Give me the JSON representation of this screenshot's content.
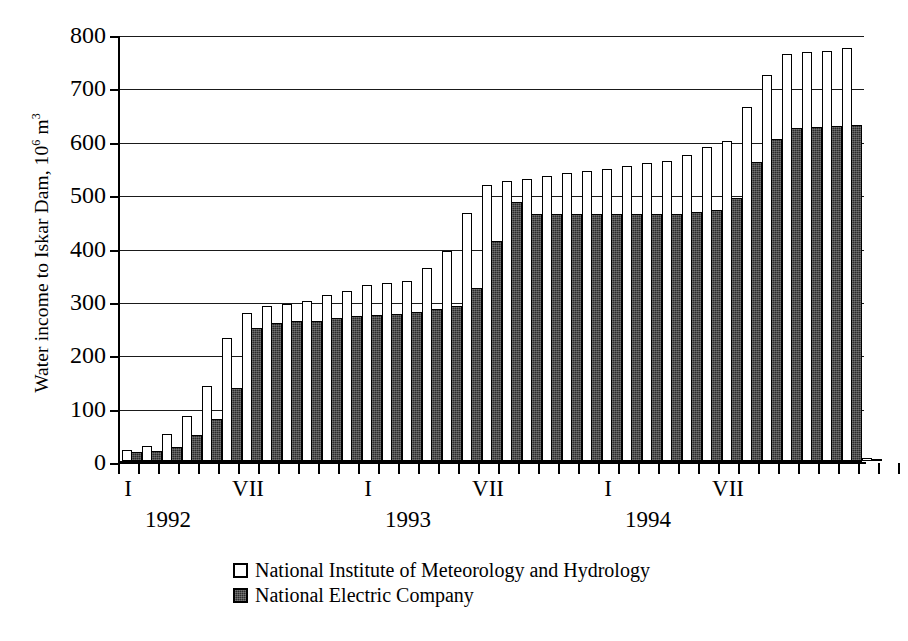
{
  "chart_data": {
    "type": "bar",
    "title": "",
    "xlabel": "",
    "ylabel": "Water income to Iskar Dam, 10^6 m^3",
    "ylabel_parts": {
      "prefix": "Water income to Iskar Dam, 10",
      "exponent": "6",
      "suffix": " m",
      "suffix_exponent": "3"
    },
    "ylim": [
      0,
      800
    ],
    "yticks": [
      0,
      100,
      200,
      300,
      400,
      500,
      600,
      700,
      800
    ],
    "ytick_labels": [
      "0",
      "100",
      "200",
      "300",
      "400",
      "500",
      "600",
      "700",
      "800"
    ],
    "grid": "horizontal",
    "legend_position": "below-axes",
    "bar_style": "grouped-pairs",
    "categories": [
      "I 1992",
      "II 1992",
      "III 1992",
      "IV 1992",
      "V 1992",
      "VI 1992",
      "VII 1992",
      "VIII 1992",
      "IX 1992",
      "X 1992",
      "XI 1992",
      "XII 1992",
      "I 1993",
      "II 1993",
      "III 1993",
      "IV 1993",
      "V 1993",
      "VI 1993",
      "VII 1993",
      "VIII 1993",
      "IX 1993",
      "X 1993",
      "XI 1993",
      "XII 1993",
      "I 1994",
      "II 1994",
      "III 1994",
      "IV 1994",
      "V 1994",
      "VI 1994",
      "VII 1994",
      "VIII 1994",
      "IX 1994",
      "X 1994",
      "XI 1994",
      "XII 1994",
      "I 1995",
      "II 1995"
    ],
    "series": [
      {
        "name": "National Institute of Meteorology and Hydrology",
        "color": "#ffffff",
        "values": [
          20,
          28,
          50,
          85,
          140,
          230,
          278,
          291,
          295,
          300,
          311,
          318,
          329,
          333,
          338,
          362,
          394,
          464,
          518,
          524,
          528,
          534,
          540,
          543,
          548,
          553,
          558,
          562,
          573,
          588,
          600,
          663,
          723,
          762,
          767,
          769,
          773,
          5
        ]
      },
      {
        "name": "National Electric Company",
        "color": "#2b2b2b",
        "values": [
          16,
          18,
          27,
          48,
          78,
          137,
          249,
          258,
          262,
          262,
          268,
          272,
          274,
          275,
          279,
          284,
          291,
          325,
          413,
          485,
          463,
          463,
          463,
          463,
          463,
          463,
          463,
          463,
          466,
          470,
          492,
          561,
          603,
          624,
          626,
          628,
          630,
          4
        ]
      }
    ]
  },
  "axis": {
    "roman_labels": [
      {
        "text": "I",
        "month_index": 0
      },
      {
        "text": "VII",
        "month_index": 6
      },
      {
        "text": "I",
        "month_index": 12
      },
      {
        "text": "VII",
        "month_index": 18
      },
      {
        "text": "I",
        "month_index": 24
      },
      {
        "text": "VII",
        "month_index": 30
      }
    ],
    "year_labels": [
      {
        "text": "1992",
        "month_index": 2
      },
      {
        "text": "1993",
        "month_index": 14
      },
      {
        "text": "1994",
        "month_index": 26
      }
    ]
  },
  "legend": {
    "entries": [
      {
        "label": "National Institute of Meteorology and Hydrology",
        "swatch": "white-square"
      },
      {
        "label": "National Electric Company",
        "swatch": "dark-square"
      }
    ]
  }
}
